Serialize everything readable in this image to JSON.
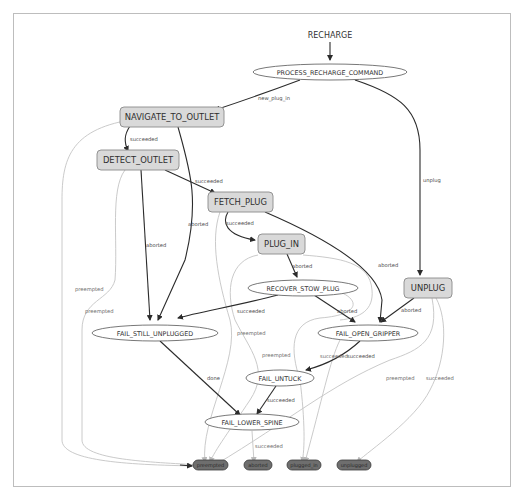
{
  "graph": {
    "title": "RECHARGE",
    "states": {
      "process_recharge_command": "PROCESS_RECHARGE_COMMAND",
      "navigate_to_outlet": "NAVIGATE_TO_OUTLET",
      "detect_outlet": "DETECT_OUTLET",
      "fetch_plug": "FETCH_PLUG",
      "plug_in": "PLUG_IN",
      "unplug": "UNPLUG",
      "recover_stow_plug": "RECOVER_STOW_PLUG",
      "fail_still_unplugged": "FAIL_STILL_UNPLUGGED",
      "fail_open_gripper": "FAIL_OPEN_GRIPPER",
      "fail_untuck": "FAIL_UNTUCK",
      "fail_lower_spine": "FAIL_LOWER_SPINE"
    },
    "outcomes": {
      "preempted": "preempted",
      "aborted": "aborted",
      "plugged_in": "plugged_in",
      "unplugged": "unplugged"
    },
    "edge_labels": {
      "new_plug_in": "new_plug_in",
      "unplug": "unplug",
      "nav_succeeded": "succeeded",
      "nav_aborted": "aborted",
      "nav_preempted": "preempted",
      "detect_succeeded": "succeeded",
      "detect_aborted": "aborted",
      "detect_preempted": "preempted",
      "fetch_succeeded": "succeeded",
      "fetch_aborted": "aborted",
      "fetch_preempted": "preempted",
      "plugin_aborted": "aborted",
      "plugin_preempted": "preempted",
      "recover_succeeded": "succeeded",
      "recover_aborted": "aborted",
      "unplug_aborted": "aborted",
      "unplug_preempted": "preempted",
      "unplug_succeeded": "succeeded",
      "still_unplugged_done": "done",
      "open_gripper_succeeded_a": "succeeded",
      "open_gripper_succeeded_b": "succeeded",
      "untuck_succeeded": "succeeded",
      "lower_spine_succeeded": "succeeded"
    }
  },
  "colors": {
    "container_fill": "#d9d9d9",
    "outcome_fill": "#6e6e6e",
    "edge_active": "#2b2b2b",
    "edge_faint": "#c4c4c4",
    "panel_border": "#bdbdbd"
  }
}
